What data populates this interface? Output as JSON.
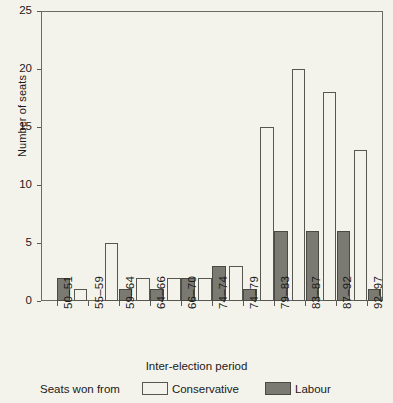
{
  "chart_data": {
    "type": "bar",
    "title": "",
    "xlabel": "Inter-election period",
    "ylabel": "Number of seats",
    "ylim": [
      0,
      25
    ],
    "yticks": [
      0,
      5,
      10,
      15,
      20,
      25
    ],
    "grid": false,
    "legend_position": "bottom",
    "legend_caption": "Seats won from",
    "categories": [
      "50–51",
      "55–59",
      "59–64",
      "64–66",
      "66–70",
      "74–74",
      "74–79",
      "79–83",
      "83–87",
      "87–92",
      "92–97"
    ],
    "series": [
      {
        "name": "Conservative",
        "color": "#f4f3eb",
        "values": [
          0,
          1,
          5,
          2,
          2,
          2,
          3,
          15,
          20,
          18,
          13
        ]
      },
      {
        "name": "Labour",
        "color": "#7a7a72",
        "values": [
          2,
          0,
          1,
          1,
          2,
          3,
          1,
          6,
          6,
          6,
          1
        ]
      }
    ]
  }
}
